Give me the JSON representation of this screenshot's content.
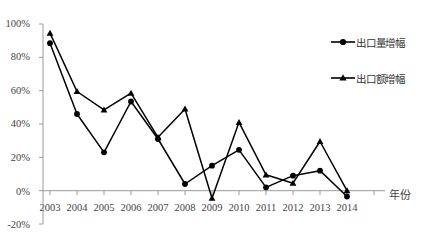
{
  "chart_data": {
    "type": "line",
    "title": "",
    "subtitle": "",
    "xlabel": "年份",
    "ylabel": "",
    "categories": [
      "2003",
      "2004",
      "2005",
      "2006",
      "2007",
      "2008",
      "2009",
      "2010",
      "2011",
      "2012",
      "2013",
      "2014"
    ],
    "series": [
      {
        "name": "出口量增幅",
        "marker": "circle",
        "values": [
          88.5,
          46.0,
          23.0,
          53.5,
          31.0,
          4.0,
          15.0,
          24.5,
          2.0,
          9.0,
          12.0,
          -3.5
        ]
      },
      {
        "name": "出口额增幅",
        "marker": "triangle",
        "values": [
          94.5,
          59.5,
          48.5,
          58.5,
          32.0,
          49.0,
          -4.5,
          41.0,
          9.5,
          4.5,
          29.5,
          0.0
        ]
      }
    ],
    "ylim": [
      -20,
      100
    ],
    "ytick_values": [
      100,
      80,
      60,
      40,
      20,
      0,
      -20
    ],
    "ytick_labels": [
      "100%",
      "80%",
      "60%",
      "40%",
      "20%",
      "0%",
      "-20%"
    ],
    "grid": false,
    "legend_position": "right-top",
    "line_color": "#000000",
    "axis_color": "#9a9a9a",
    "background": "#ffffff"
  },
  "legend": {
    "items": [
      {
        "label": "出口量增幅",
        "marker": "circle-marker-icon"
      },
      {
        "label": "出口额增幅",
        "marker": "triangle-marker-icon"
      }
    ]
  }
}
